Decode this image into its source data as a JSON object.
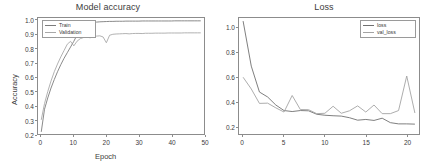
{
  "figure": {
    "background": "#ffffff",
    "width": 432,
    "height": 167
  },
  "panels": {
    "left": {
      "title": "Model accuracy",
      "xlabel": "Epoch",
      "ylabel": "Accuracy",
      "legend": {
        "train_label": "Train",
        "validation_label": "Validation"
      }
    },
    "right": {
      "title": "Loss",
      "xlabel": "",
      "ylabel": "",
      "legend": {
        "loss_label": "loss",
        "val_loss_label": "val_loss"
      }
    }
  },
  "colors": {
    "train": "#7b7b7b",
    "validation": "#a8a8a8",
    "loss": "#6f6f6f",
    "val_loss": "#a3a3a3",
    "axis": "#8c8c8c",
    "text": "#3c3c3c"
  },
  "chart_data": [
    {
      "type": "line",
      "title": "Model accuracy",
      "xlabel": "Epoch",
      "ylabel": "Accuracy",
      "xlim": [
        -1,
        50
      ],
      "ylim": [
        0.2,
        1.02
      ],
      "xticks": [
        0,
        10,
        20,
        30,
        40,
        50
      ],
      "yticks": [
        0.2,
        0.3,
        0.4,
        0.5,
        0.6,
        0.7,
        0.8,
        0.9,
        1.0
      ],
      "ytick_labels": [
        "0.2",
        "0.3",
        "0.4",
        "0.5",
        "0.6",
        "0.7",
        "0.8",
        "0.9",
        "1.0"
      ],
      "xtick_labels": [
        "0",
        "10",
        "20",
        "30",
        "40",
        "50"
      ],
      "grid": false,
      "legend_position": "upper left",
      "x": [
        0,
        1,
        2,
        3,
        4,
        5,
        6,
        7,
        8,
        9,
        10,
        11,
        12,
        13,
        14,
        15,
        16,
        17,
        18,
        19,
        20,
        21,
        22,
        23,
        24,
        25,
        26,
        27,
        28,
        29,
        30,
        31,
        32,
        33,
        34,
        35,
        36,
        37,
        38,
        39,
        40,
        41,
        42,
        43,
        44,
        45,
        46,
        47,
        48,
        49
      ],
      "series": [
        {
          "name": "Train",
          "values": [
            0.215,
            0.375,
            0.455,
            0.525,
            0.585,
            0.64,
            0.69,
            0.735,
            0.775,
            0.815,
            0.855,
            0.9,
            0.94,
            0.965,
            0.978,
            0.985,
            0.989,
            0.991,
            0.993,
            0.994,
            0.995,
            0.996,
            0.996,
            0.997,
            0.997,
            0.997,
            0.998,
            0.998,
            0.998,
            0.998,
            0.998,
            0.999,
            0.999,
            0.999,
            0.999,
            0.999,
            0.999,
            0.999,
            0.999,
            0.999,
            0.999,
            1.0,
            1.0,
            1.0,
            1.0,
            1.0,
            1.0,
            1.0,
            1.0,
            1.0
          ]
        },
        {
          "name": "Validation",
          "values": [
            0.3,
            0.415,
            0.5,
            0.575,
            0.64,
            0.695,
            0.745,
            0.79,
            0.835,
            0.855,
            0.823,
            0.856,
            0.874,
            0.882,
            0.886,
            0.88,
            0.888,
            0.892,
            0.894,
            0.886,
            0.845,
            0.898,
            0.905,
            0.907,
            0.908,
            0.909,
            0.91,
            0.908,
            0.91,
            0.911,
            0.911,
            0.91,
            0.912,
            0.912,
            0.912,
            0.913,
            0.913,
            0.913,
            0.913,
            0.914,
            0.914,
            0.914,
            0.914,
            0.914,
            0.915,
            0.915,
            0.915,
            0.915,
            0.915,
            0.915
          ]
        }
      ]
    },
    {
      "type": "line",
      "title": "Loss",
      "xlabel": "",
      "ylabel": "",
      "xlim": [
        -0.5,
        21.5
      ],
      "ylim": [
        0.14,
        1.08
      ],
      "xticks": [
        0,
        5,
        10,
        15,
        20
      ],
      "yticks": [
        0.2,
        0.4,
        0.6,
        0.8,
        1.0
      ],
      "ytick_labels": [
        "0.2",
        "0.4",
        "0.6",
        "0.8",
        "1.0"
      ],
      "xtick_labels": [
        "0",
        "5",
        "10",
        "15",
        "20"
      ],
      "grid": false,
      "legend_position": "upper right",
      "x": [
        0,
        1,
        2,
        3,
        4,
        5,
        6,
        7,
        8,
        9,
        10,
        11,
        12,
        13,
        14,
        15,
        16,
        17,
        18,
        19,
        20,
        21
      ],
      "series": [
        {
          "name": "loss",
          "values": [
            1.055,
            0.69,
            0.48,
            0.44,
            0.375,
            0.33,
            0.322,
            0.33,
            0.328,
            0.3,
            0.292,
            0.288,
            0.285,
            0.272,
            0.252,
            0.258,
            0.25,
            0.268,
            0.232,
            0.222,
            0.222,
            0.22
          ]
        },
        {
          "name": "val_loss",
          "values": [
            0.6,
            0.505,
            0.388,
            0.39,
            0.352,
            0.318,
            0.452,
            0.338,
            0.337,
            0.305,
            0.308,
            0.365,
            0.308,
            0.328,
            0.368,
            0.318,
            0.375,
            0.305,
            0.305,
            0.33,
            0.61,
            0.31
          ]
        }
      ]
    }
  ]
}
